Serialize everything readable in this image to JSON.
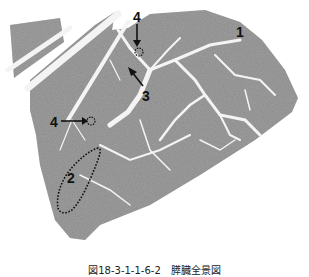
{
  "figure": {
    "colors": {
      "tissue": "#8a8a8a",
      "tissue_dark": "#6f6f6f",
      "septa": "#f2f2f2",
      "background": "#ffffff",
      "annotation": "#111111"
    },
    "labels": [
      {
        "id": "1",
        "text": "1",
        "x": 238,
        "y": 26
      },
      {
        "id": "2",
        "text": "2",
        "x": 66,
        "y": 172
      },
      {
        "id": "3",
        "text": "3",
        "x": 142,
        "y": 88
      },
      {
        "id": "4a",
        "text": "4",
        "x": 133,
        "y": 10
      },
      {
        "id": "4b",
        "text": "4",
        "x": 50,
        "y": 114
      }
    ]
  },
  "caption": {
    "text": "図18-3-1-1-6-2　膵臓全景図"
  }
}
